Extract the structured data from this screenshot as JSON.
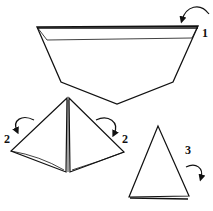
{
  "diagram": {
    "type": "origami-folding-instructions",
    "steps": [
      {
        "label": "1",
        "description": "fold top edge down (valley fold)"
      },
      {
        "label": "2",
        "description": "fold both sides inward"
      },
      {
        "label": "2",
        "description": "fold both sides inward"
      },
      {
        "label": "3",
        "description": "fold back"
      }
    ],
    "colors": {
      "line": "#111111",
      "background": "#ffffff"
    }
  }
}
